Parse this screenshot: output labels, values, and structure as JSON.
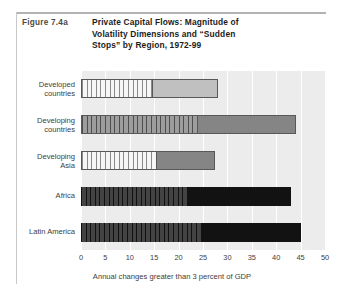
{
  "figure": {
    "number": "Figure 7.4a",
    "title_lines": [
      "Private Capital Flows: Magnitude of",
      "Volatility Dimensions and “Sudden",
      "Stops” by Region,  1972-99"
    ],
    "title_full": "Private Capital Flows: Magnitude of Volatility Dimensions and “Sudden Stops” by Region, 1972-99"
  },
  "colors": {
    "plot_background": "#ececec",
    "gridline": "#ffffff",
    "bar_outline": "#585858",
    "light_fill": "#c0c0c0",
    "mid_fill": "#858585",
    "black_fill": "#121212",
    "text": "#3d3d3d",
    "rule": "#b3b3b3"
  },
  "chart_data": {
    "type": "bar",
    "orientation": "horizontal",
    "stacked": true,
    "title": "Private Capital Flows: Magnitude of Volatility Dimensions and “Sudden Stops” by Region, 1972-99",
    "xlabel": "Annual changes greater than 3 percent of GDP",
    "ylabel": "",
    "xlim": [
      0,
      50
    ],
    "xticks": [
      0,
      5,
      10,
      15,
      20,
      25,
      30,
      35,
      40,
      45,
      50
    ],
    "xtick_labels": [
      "0",
      "5",
      "10",
      "15",
      "20",
      "25",
      "30",
      "35",
      "40",
      "45",
      "50"
    ],
    "grid": "vertical-white",
    "legend": "none",
    "categories": [
      "Developed countries",
      "Developing countries",
      "Developing Asia",
      "Africa",
      "Latin America"
    ],
    "series": [
      {
        "name": "Volatility dimension (hatched segment)",
        "values": [
          14.7,
          24.0,
          15.5,
          22.0,
          24.6
        ]
      },
      {
        "name": "Sudden stops (solid segment)",
        "values": [
          13.3,
          20.0,
          12.0,
          21.0,
          20.4
        ]
      }
    ],
    "totals": [
      28.0,
      44.0,
      27.5,
      43.0,
      45.0
    ],
    "rows": [
      {
        "label": "Developed\ncountries",
        "label_plain": "Developed countries",
        "hatch_value": 14.7,
        "solid_value": 13.3,
        "total": 28.0,
        "hatch_style": "hatch-light",
        "solid_style": "fill-light",
        "outlined": true
      },
      {
        "label": "Developing\ncountries",
        "label_plain": "Developing countries",
        "hatch_value": 24.0,
        "solid_value": 20.0,
        "total": 44.0,
        "hatch_style": "hatch-mid",
        "solid_style": "fill-mid",
        "outlined": true
      },
      {
        "label": "Developing\nAsia",
        "label_plain": "Developing Asia",
        "hatch_value": 15.5,
        "solid_value": 12.0,
        "total": 27.5,
        "hatch_style": "hatch-light",
        "solid_style": "fill-mid",
        "outlined": true
      },
      {
        "label": "Africa",
        "label_plain": "Africa",
        "hatch_value": 22.0,
        "solid_value": 21.0,
        "total": 43.0,
        "hatch_style": "hatch-dark",
        "solid_style": "fill-black",
        "outlined": false
      },
      {
        "label": "Latin America",
        "label_plain": "Latin America",
        "hatch_value": 24.6,
        "solid_value": 20.4,
        "total": 45.0,
        "hatch_style": "hatch-dark",
        "solid_style": "fill-black",
        "outlined": false
      }
    ]
  }
}
